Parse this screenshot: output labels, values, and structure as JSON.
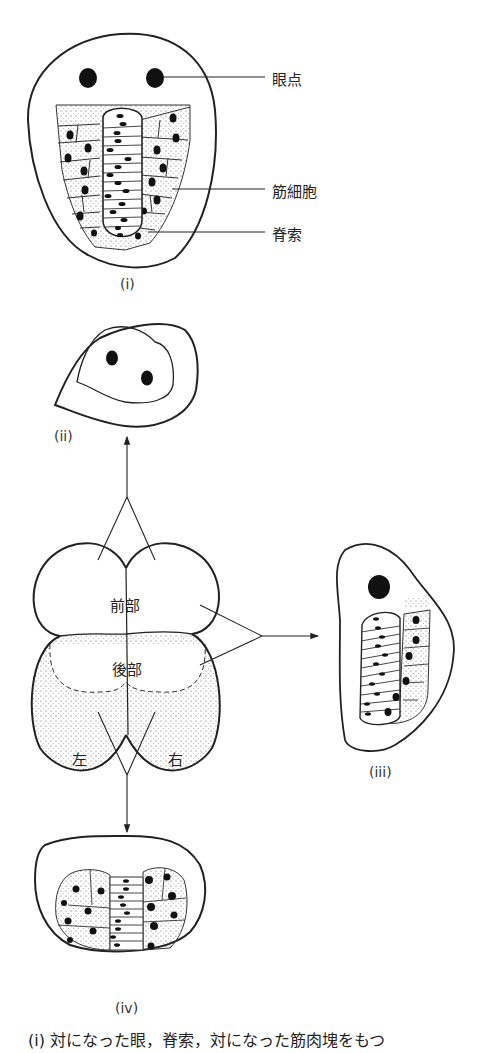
{
  "figure_i": {
    "label": "(i)",
    "callouts": [
      "眼点",
      "筋細胞",
      "脊索"
    ]
  },
  "figure_ii": {
    "label": "(ii)"
  },
  "figure_iii": {
    "label": "(iii)"
  },
  "figure_iv": {
    "label": "(iv)"
  },
  "embryo": {
    "anterior": "前部",
    "posterior": "後部",
    "left": "左",
    "right": "右"
  },
  "caption": "(i) 対になった眼，脊索，対になった筋肉塊をもつ"
}
